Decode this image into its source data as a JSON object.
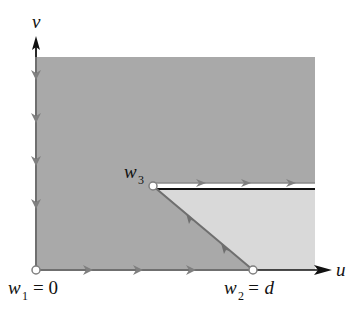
{
  "diagram": {
    "type": "complex-plane-mapping",
    "axes": {
      "horizontal_label": "u",
      "vertical_label": "v"
    },
    "points": [
      {
        "id": "w1",
        "label": "w",
        "subscript": "1",
        "suffix": "= 0"
      },
      {
        "id": "w2",
        "label": "w",
        "subscript": "2",
        "suffix": "= d"
      },
      {
        "id": "w3",
        "label": "w",
        "subscript": "3",
        "suffix": ""
      }
    ],
    "regions": [
      {
        "id": "dark-region",
        "description": "dark shaded region",
        "color": "#a9a9a9"
      },
      {
        "id": "light-region",
        "description": "light shaded region below slit, right of diagonal",
        "color": "#d9d9d9"
      }
    ],
    "colors": {
      "axis": "#111111",
      "boundary": "#7f7f7f",
      "arrow": "#7f7f7f",
      "point_fill": "#ffffff"
    }
  }
}
